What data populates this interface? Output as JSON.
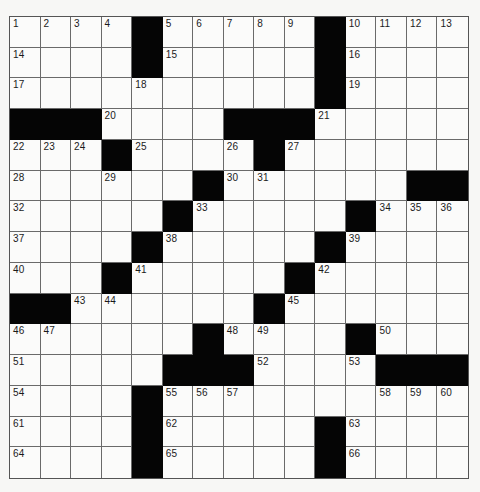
{
  "puzzle": {
    "rows": 15,
    "cols": 15,
    "colors": {
      "block": "#050505",
      "cell": "#fbfbfa",
      "line": "#6a6a6a",
      "number": "#1a1a1a"
    },
    "grid": [
      [
        "1",
        "2",
        "3",
        "4",
        "#",
        "5",
        "6",
        "7",
        "8",
        "9",
        "#",
        "10",
        "11",
        "12",
        "13"
      ],
      [
        "14",
        "",
        "",
        "",
        "#",
        "15",
        "",
        "",
        "",
        "",
        "#",
        "16",
        "",
        "",
        ""
      ],
      [
        "17",
        "",
        "",
        "",
        "18",
        "",
        "",
        "",
        "",
        "",
        "#",
        "19",
        "",
        "",
        ""
      ],
      [
        "#",
        "#",
        "#",
        "20",
        "",
        "",
        "",
        "#",
        "#",
        "#",
        "21",
        "",
        "",
        "",
        ""
      ],
      [
        "22",
        "23",
        "24",
        "#",
        "25",
        "",
        "",
        "26",
        "#",
        "27",
        "",
        "",
        "",
        "",
        ""
      ],
      [
        "28",
        "",
        "",
        "29",
        "",
        "",
        "#",
        "30",
        "31",
        "",
        "",
        "",
        "",
        "#",
        "#"
      ],
      [
        "32",
        "",
        "",
        "",
        "",
        "#",
        "33",
        "",
        "",
        "",
        "",
        "#",
        "34",
        "35",
        "36"
      ],
      [
        "37",
        "",
        "",
        "",
        "#",
        "38",
        "",
        "",
        "",
        "",
        "#",
        "39",
        "",
        "",
        ""
      ],
      [
        "40",
        "",
        "",
        "#",
        "41",
        "",
        "",
        "",
        "",
        "#",
        "42",
        "",
        "",
        "",
        ""
      ],
      [
        "#",
        "#",
        "43",
        "44",
        "",
        "",
        "",
        "",
        "#",
        "45",
        "",
        "",
        "",
        "",
        ""
      ],
      [
        "46",
        "47",
        "",
        "",
        "",
        "",
        "#",
        "48",
        "49",
        "",
        "",
        "#",
        "50",
        "",
        ""
      ],
      [
        "51",
        "",
        "",
        "",
        "",
        "#",
        "#",
        "#",
        "52",
        "",
        "",
        "53",
        "#",
        "#",
        "#"
      ],
      [
        "54",
        "",
        "",
        "",
        "#",
        "55",
        "56",
        "57",
        "",
        "",
        "",
        "",
        "58",
        "59",
        "60"
      ],
      [
        "61",
        "",
        "",
        "",
        "#",
        "62",
        "",
        "",
        "",
        "",
        "#",
        "63",
        "",
        "",
        ""
      ],
      [
        "64",
        "",
        "",
        "",
        "#",
        "65",
        "",
        "",
        "",
        "",
        "#",
        "66",
        "",
        "",
        ""
      ]
    ]
  }
}
